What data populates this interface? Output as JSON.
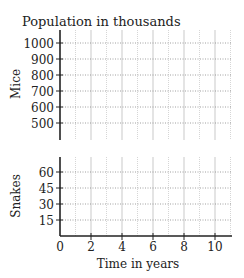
{
  "chart_data": [
    {
      "type": "line",
      "title": "Population in thousands",
      "ylabel": "Mice",
      "xlabel": "",
      "yticks": [
        500,
        600,
        700,
        800,
        900,
        1000
      ],
      "ylim": [
        400,
        1080
      ],
      "xlim": [
        0,
        11
      ],
      "grid": true,
      "series": []
    },
    {
      "type": "line",
      "title": "",
      "ylabel": "Snakes",
      "xlabel": "Time in years",
      "yticks": [
        15,
        30,
        45,
        60
      ],
      "xticks": [
        0,
        2,
        4,
        6,
        8,
        10
      ],
      "ylim": [
        0,
        70
      ],
      "xlim": [
        0,
        11
      ],
      "grid": true,
      "series": []
    }
  ],
  "labels": {
    "title": "Population in thousands",
    "mice_ylabel": "Mice",
    "snakes_ylabel": "Snakes",
    "xlabel": "Time in years"
  }
}
